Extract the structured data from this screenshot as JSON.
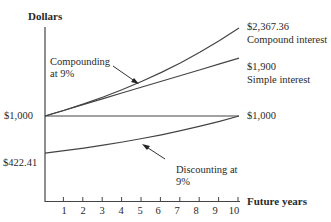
{
  "chart_data": {
    "type": "line",
    "title": "",
    "xlabel": "Future years",
    "ylabel": "Dollars",
    "x": [
      0,
      1,
      2,
      3,
      4,
      5,
      6,
      7,
      8,
      9,
      10
    ],
    "xticks": [
      "1",
      "2",
      "3",
      "4",
      "5",
      "6",
      "7",
      "8",
      "9",
      "10"
    ],
    "series": [
      {
        "name": "Compound interest",
        "values": [
          1000,
          1090,
          1188.1,
          1295.03,
          1411.58,
          1538.62,
          1677.1,
          1828.04,
          1992.56,
          2171.89,
          2367.36
        ],
        "end_label": "$2,367.36"
      },
      {
        "name": "Simple interest",
        "values": [
          1000,
          1090,
          1180,
          1270,
          1360,
          1450,
          1540,
          1630,
          1720,
          1810,
          1900
        ],
        "end_label": "$1,900"
      },
      {
        "name": "Constant",
        "values": [
          1000,
          1000,
          1000,
          1000,
          1000,
          1000,
          1000,
          1000,
          1000,
          1000,
          1000
        ],
        "end_label": "$1,000"
      },
      {
        "name": "Discounting at 9%",
        "values": [
          422.41,
          460.43,
          501.87,
          547.03,
          596.27,
          649.93,
          708.43,
          772.18,
          841.68,
          917.43,
          1000
        ]
      }
    ],
    "start_labels": [
      "$1,000",
      "$422.41"
    ],
    "annotations": [
      "Compounding at 9%",
      "Discounting at 9%"
    ],
    "grid": false,
    "legend": "none"
  },
  "labels": {
    "y_axis": "Dollars",
    "x_axis": "Future years",
    "start_1000": "$1,000",
    "start_422": "$422.41",
    "end_compound_value": "$2,367.36",
    "end_compound_name": "Compound interest",
    "end_simple_value": "$1,900",
    "end_simple_name": "Simple interest",
    "end_constant": "$1,000",
    "annot_compound_1": "Compounding",
    "annot_compound_2": "at 9%",
    "annot_discount_1": "Discounting at",
    "annot_discount_2": "9%"
  },
  "ticks": [
    "1",
    "2",
    "3",
    "4",
    "5",
    "6",
    "7",
    "8",
    "9",
    "10"
  ]
}
